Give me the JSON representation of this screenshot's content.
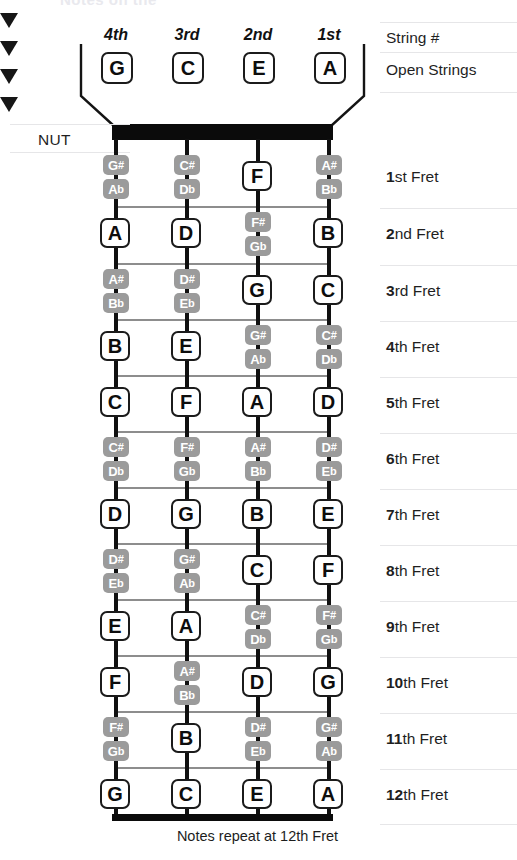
{
  "meta": {
    "instrument": "ukulele-fretboard",
    "title_ghost": "Notes on the",
    "caption": "Notes repeat at 12th Fret",
    "nut_label": "NUT",
    "colors": {
      "natural_bg": "#ffffff",
      "natural_border": "#1b1b1b",
      "accidental_bg": "#9b9b9b",
      "accidental_text": "#ffffff",
      "nut_bar": "#0b0b0b",
      "string": "#101010",
      "fret_line": "#8d8d8d",
      "rule": "#d8d8da"
    }
  },
  "right_labels": {
    "string_number": "String #",
    "open_strings": "Open Strings"
  },
  "strings": [
    {
      "ordinal": "4th",
      "open_note": "G"
    },
    {
      "ordinal": "3rd",
      "open_note": "C"
    },
    {
      "ordinal": "2nd",
      "open_note": "E"
    },
    {
      "ordinal": "1st",
      "open_note": "A"
    }
  ],
  "fret_labels": [
    {
      "num": "1",
      "suffix": "st Fret"
    },
    {
      "num": "2",
      "suffix": "nd Fret"
    },
    {
      "num": "3",
      "suffix": "rd Fret"
    },
    {
      "num": "4",
      "suffix": "th Fret"
    },
    {
      "num": "5",
      "suffix": "th Fret"
    },
    {
      "num": "6",
      "suffix": "th Fret"
    },
    {
      "num": "7",
      "suffix": "th Fret"
    },
    {
      "num": "8",
      "suffix": "th Fret"
    },
    {
      "num": "9",
      "suffix": "th Fret"
    },
    {
      "num": "10",
      "suffix": "th Fret"
    },
    {
      "num": "11",
      "suffix": "th Fret"
    },
    {
      "num": "12",
      "suffix": "th Fret"
    }
  ],
  "frets": [
    {
      "fret": 1,
      "notes": [
        {
          "type": "accidental",
          "sharp": "G#",
          "flat": "Ab"
        },
        {
          "type": "accidental",
          "sharp": "C#",
          "flat": "Db"
        },
        {
          "type": "natural",
          "name": "F"
        },
        {
          "type": "accidental",
          "sharp": "A#",
          "flat": "Bb"
        }
      ]
    },
    {
      "fret": 2,
      "notes": [
        {
          "type": "natural",
          "name": "A"
        },
        {
          "type": "natural",
          "name": "D"
        },
        {
          "type": "accidental",
          "sharp": "F#",
          "flat": "Gb"
        },
        {
          "type": "natural",
          "name": "B"
        }
      ]
    },
    {
      "fret": 3,
      "notes": [
        {
          "type": "accidental",
          "sharp": "A#",
          "flat": "Bb"
        },
        {
          "type": "accidental",
          "sharp": "D#",
          "flat": "Eb"
        },
        {
          "type": "natural",
          "name": "G"
        },
        {
          "type": "natural",
          "name": "C"
        }
      ]
    },
    {
      "fret": 4,
      "notes": [
        {
          "type": "natural",
          "name": "B"
        },
        {
          "type": "natural",
          "name": "E"
        },
        {
          "type": "accidental",
          "sharp": "G#",
          "flat": "Ab"
        },
        {
          "type": "accidental",
          "sharp": "C#",
          "flat": "Db"
        }
      ]
    },
    {
      "fret": 5,
      "notes": [
        {
          "type": "natural",
          "name": "C"
        },
        {
          "type": "natural",
          "name": "F"
        },
        {
          "type": "natural",
          "name": "A"
        },
        {
          "type": "natural",
          "name": "D"
        }
      ]
    },
    {
      "fret": 6,
      "notes": [
        {
          "type": "accidental",
          "sharp": "C#",
          "flat": "Db"
        },
        {
          "type": "accidental",
          "sharp": "F#",
          "flat": "Gb"
        },
        {
          "type": "accidental",
          "sharp": "A#",
          "flat": "Bb"
        },
        {
          "type": "accidental",
          "sharp": "D#",
          "flat": "Eb"
        }
      ]
    },
    {
      "fret": 7,
      "notes": [
        {
          "type": "natural",
          "name": "D"
        },
        {
          "type": "natural",
          "name": "G"
        },
        {
          "type": "natural",
          "name": "B"
        },
        {
          "type": "natural",
          "name": "E"
        }
      ]
    },
    {
      "fret": 8,
      "notes": [
        {
          "type": "accidental",
          "sharp": "D#",
          "flat": "Eb"
        },
        {
          "type": "accidental",
          "sharp": "G#",
          "flat": "Ab"
        },
        {
          "type": "natural",
          "name": "C"
        },
        {
          "type": "natural",
          "name": "F"
        }
      ]
    },
    {
      "fret": 9,
      "notes": [
        {
          "type": "natural",
          "name": "E"
        },
        {
          "type": "natural",
          "name": "A"
        },
        {
          "type": "accidental",
          "sharp": "C#",
          "flat": "Db"
        },
        {
          "type": "accidental",
          "sharp": "F#",
          "flat": "Gb"
        }
      ]
    },
    {
      "fret": 10,
      "notes": [
        {
          "type": "natural",
          "name": "F"
        },
        {
          "type": "accidental",
          "sharp": "A#",
          "flat": "Bb"
        },
        {
          "type": "natural",
          "name": "D"
        },
        {
          "type": "natural",
          "name": "G"
        }
      ]
    },
    {
      "fret": 11,
      "notes": [
        {
          "type": "accidental",
          "sharp": "F#",
          "flat": "Gb"
        },
        {
          "type": "natural",
          "name": "B"
        },
        {
          "type": "accidental",
          "sharp": "D#",
          "flat": "Eb"
        },
        {
          "type": "accidental",
          "sharp": "G#",
          "flat": "Ab"
        }
      ]
    },
    {
      "fret": 12,
      "notes": [
        {
          "type": "natural",
          "name": "G"
        },
        {
          "type": "natural",
          "name": "C"
        },
        {
          "type": "natural",
          "name": "E"
        },
        {
          "type": "natural",
          "name": "A"
        }
      ]
    }
  ],
  "geometry": {
    "string_x": [
      116,
      187,
      258,
      329
    ],
    "fret_row_centers": [
      177,
      234,
      291,
      347,
      403,
      459,
      515,
      571,
      627,
      683,
      739,
      795
    ],
    "fret_line_y": [
      206,
      263,
      319,
      375,
      431,
      487,
      543,
      599,
      655,
      711,
      767
    ],
    "nut_y": 124,
    "end_bar_y": 814
  }
}
